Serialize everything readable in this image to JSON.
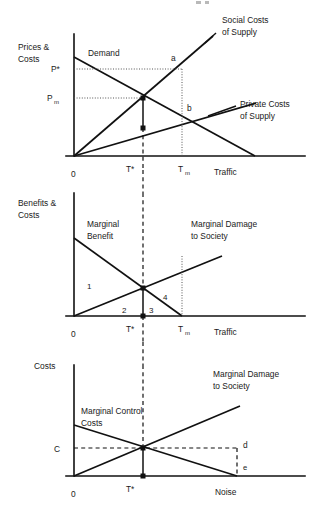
{
  "figure": {
    "title": "",
    "panels": [
      {
        "id": "panel-traffic-prices",
        "y_axis_label_line1": "Prices &",
        "y_axis_label_line2": "Costs",
        "x_axis_label": "Traffic",
        "origin_label": "0",
        "y_ticks": [
          {
            "key": "p_star",
            "label": "P*",
            "value_y": 69
          },
          {
            "key": "p_m",
            "label": "P",
            "sub": "m",
            "value_y": 98
          }
        ],
        "x_ticks": [
          {
            "key": "t_star",
            "label": "T*",
            "value_x": 143
          },
          {
            "key": "t_m",
            "label": "T",
            "sub": "m",
            "value_x": 182
          }
        ],
        "curves": [
          {
            "name": "Demand",
            "label": "Demand",
            "type": "line",
            "from": [
              74,
              57
            ],
            "to": [
              255,
              156
            ]
          },
          {
            "name": "Social Costs of Supply",
            "label_line1": "Social Costs",
            "label_line2": "of Supply",
            "type": "line",
            "from": [
              74,
              156
            ],
            "to": [
              213,
              36
            ]
          },
          {
            "name": "Private Costs of Supply",
            "label_line1": "Private Costs",
            "label_line2": "of Supply",
            "type": "line",
            "from": [
              74,
              156
            ],
            "to": [
              256,
              103
            ]
          }
        ],
        "points": [
          {
            "label": "a",
            "x": 182,
            "y": 69
          },
          {
            "label": "b",
            "x": 182,
            "y": 114
          }
        ],
        "markers": [
          {
            "key": "equilibrium-social",
            "x": 143,
            "y": 98
          },
          {
            "key": "equilibrium-private",
            "x": 143,
            "y": 128
          }
        ]
      },
      {
        "id": "panel-benefits-costs",
        "y_axis_label_line1": "Benefits &",
        "y_axis_label_line2": "Costs",
        "x_axis_label": "Traffic",
        "origin_label": "0",
        "x_ticks": [
          {
            "key": "t_star",
            "label": "T*",
            "value_x": 143
          },
          {
            "key": "t_m",
            "label": "T",
            "sub": "m",
            "value_x": 182
          }
        ],
        "curves": [
          {
            "name": "Marginal Benefit",
            "label_line1": "Marginal",
            "label_line2": "Benefit",
            "type": "line",
            "from": [
              74,
              238
            ],
            "to": [
              182,
              316
            ]
          },
          {
            "name": "Marginal Damage to Society",
            "label_line1": "Marginal Damage",
            "label_line2": "to Society",
            "type": "line",
            "from": [
              74,
              316
            ],
            "to": [
              222,
              256
            ]
          }
        ],
        "area_numbers": [
          {
            "label": "1",
            "x": 90,
            "y": 286
          },
          {
            "label": "2",
            "x": 125,
            "y": 310
          },
          {
            "label": "3",
            "x": 152,
            "y": 310
          },
          {
            "label": "4",
            "x": 166,
            "y": 297
          }
        ],
        "markers": [
          {
            "key": "intersection",
            "x": 143,
            "y": 288
          },
          {
            "key": "axis-foot",
            "x": 143,
            "y": 316
          }
        ]
      },
      {
        "id": "panel-noise-costs",
        "y_axis_label_line1": "Costs",
        "x_axis_label": "Noise",
        "origin_label": "0",
        "y_ticks": [
          {
            "key": "c",
            "label": "C",
            "value_y": 448
          }
        ],
        "x_ticks": [
          {
            "key": "t_star",
            "label": "T*",
            "value_x": 143
          }
        ],
        "curves": [
          {
            "name": "Marginal Control Costs",
            "label_line1": "Marginal Control",
            "label_line2": "Costs",
            "type": "line",
            "from": [
              74,
              425
            ],
            "to": [
              237,
              476
            ]
          },
          {
            "name": "Marginal Damage to Society",
            "label_line1": "Marginal Damage",
            "label_line2": "to Society",
            "type": "line",
            "from": [
              74,
              476
            ],
            "to": [
              240,
              406
            ]
          }
        ],
        "points": [
          {
            "label": "d",
            "x": 245,
            "y": 445
          },
          {
            "label": "e",
            "x": 245,
            "y": 467
          }
        ],
        "markers": [
          {
            "key": "intersection",
            "x": 143,
            "y": 448
          },
          {
            "key": "axis-foot",
            "x": 143,
            "y": 476
          }
        ]
      }
    ]
  }
}
